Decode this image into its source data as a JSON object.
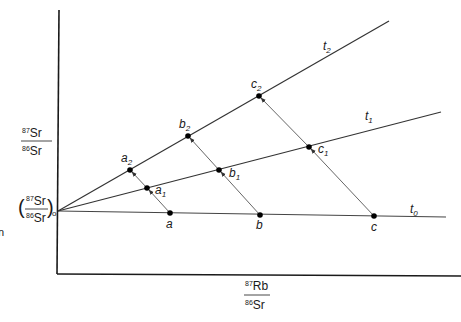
{
  "diagram": {
    "y_axis_label": {
      "top": "87Sr",
      "top_sup": "87",
      "top_el": "Sr",
      "bottom_sup": "86",
      "bottom_el": "Sr"
    },
    "x_axis_label": {
      "top_sup": "87",
      "top_el": "Rb",
      "bottom_sup": "86",
      "bottom_el": "Sr"
    },
    "intercept_label": {
      "top_sup": "87",
      "top_el": "Sr",
      "bottom_sup": "86",
      "bottom_el": "Sr",
      "subscript": "o"
    },
    "edge_fragment": "n",
    "isochrons": [
      {
        "name": "t0",
        "label": "t",
        "sub": "0"
      },
      {
        "name": "t1",
        "label": "t",
        "sub": "1"
      },
      {
        "name": "t2",
        "label": "t",
        "sub": "2"
      }
    ],
    "points": [
      {
        "id": "a",
        "label": "a",
        "sub": ""
      },
      {
        "id": "a1",
        "label": "a",
        "sub": "1"
      },
      {
        "id": "a2",
        "label": "a",
        "sub": "2"
      },
      {
        "id": "b",
        "label": "b",
        "sub": ""
      },
      {
        "id": "b1",
        "label": "b",
        "sub": "1"
      },
      {
        "id": "b2",
        "label": "b",
        "sub": "2"
      },
      {
        "id": "c",
        "label": "c",
        "sub": ""
      },
      {
        "id": "c1",
        "label": "c",
        "sub": "1"
      },
      {
        "id": "c2",
        "label": "c",
        "sub": "2"
      }
    ],
    "colors": {
      "axis": "#1a1a1a",
      "isochron": "#333333",
      "arrow": "#555555",
      "point": "#000000"
    }
  }
}
